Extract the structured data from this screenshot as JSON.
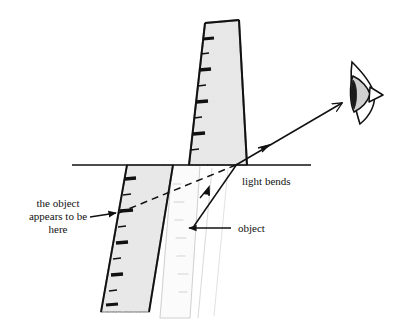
{
  "figure": {
    "background_color": "#ffffff",
    "ink_color": "#111111",
    "ruler_fill_color": "#e8e8e8",
    "ruler_edge_color": "#111111",
    "ghost_ruler_color": "#cfcfcf",
    "labels": {
      "apparent_position_line1": "the object",
      "apparent_position_line2": "appears to be",
      "apparent_position_line3": "here",
      "light_bends": "light bends",
      "object": "object"
    },
    "elements": {
      "water_surface_name": "water surface line",
      "eye_name": "observer eye",
      "upper_ruler_name": "ruler above water",
      "lower_ruler_name": "apparent ruler below water",
      "ghost_ruler_name": "actual ruler position",
      "refracted_ray_name": "refracted light ray to eye",
      "incident_ray_name": "incident light ray from object",
      "sight_line_name": "apparent line of sight"
    },
    "geometry": {
      "water_line": {
        "x1": 72,
        "y1": 165,
        "x2": 311,
        "y2": 165
      },
      "refraction_point": {
        "x": 236,
        "y": 165
      },
      "eye_center": {
        "x": 364,
        "y": 92
      },
      "upper_ruler_quad": "205,23 238,20 246,165 188,165",
      "lower_ruler_quad": "127,165 173,165 148,310 100,310",
      "ghost_ruler_quad": "172,165 200,165 188,315 158,315",
      "ray_to_eye": {
        "x1": 236,
        "y1": 165,
        "x2": 340,
        "y2": 104
      },
      "ray_from_object": {
        "x1": 196,
        "y1": 224,
        "x2": 236,
        "y2": 165
      },
      "sight_line_dashed": {
        "x1": 236,
        "y1": 165,
        "x2": 116,
        "y2": 214
      },
      "object_pointer": {
        "x1": 224,
        "y1": 228,
        "x2": 190,
        "y2": 228
      },
      "apparent_pointer": {
        "x1": 90,
        "y1": 217,
        "x2": 116,
        "y2": 213
      }
    },
    "label_positions": {
      "apparent_position": {
        "x": 58,
        "y": 212
      },
      "light_bends": {
        "x": 242,
        "y": 182
      },
      "object": {
        "x": 238,
        "y": 229
      }
    },
    "tick_counts": {
      "upper_ruler": 8,
      "lower_ruler": 9
    }
  }
}
